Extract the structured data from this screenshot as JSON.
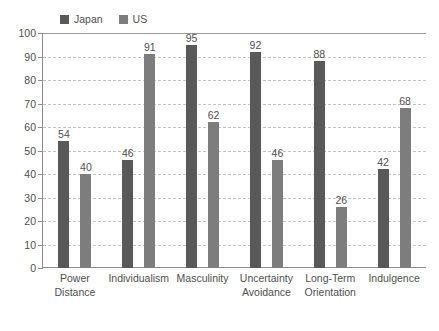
{
  "chart_data": {
    "type": "bar",
    "title": "",
    "xlabel": "",
    "ylabel": "",
    "ylim": [
      0,
      100
    ],
    "ytick_step": 10,
    "yticks": [
      100,
      90,
      80,
      70,
      60,
      50,
      40,
      30,
      20,
      10,
      0
    ],
    "grid": true,
    "legend_position": "top-left",
    "categories": [
      "Power Distance",
      "Individualism",
      "Masculinity",
      "Uncertainty Avoidance",
      "Long-Term Orientation",
      "Indulgence"
    ],
    "category_lines": [
      [
        "Power",
        "Distance"
      ],
      [
        "Individualism",
        ""
      ],
      [
        "Masculinity",
        ""
      ],
      [
        "Uncertainty",
        "Avoidance"
      ],
      [
        "Long-Term",
        "Orientation"
      ],
      [
        "Indulgence",
        ""
      ]
    ],
    "series": [
      {
        "name": "Japan",
        "color": "#595959",
        "values": [
          54,
          46,
          95,
          92,
          88,
          42
        ]
      },
      {
        "name": "US",
        "color": "#7d7d7d",
        "values": [
          40,
          91,
          62,
          46,
          26,
          68
        ]
      }
    ]
  },
  "legend": {
    "items": [
      {
        "label": "Japan",
        "color": "#595959"
      },
      {
        "label": "US",
        "color": "#7d7d7d"
      }
    ]
  },
  "axis": {
    "y_labels": [
      "100",
      "90",
      "80",
      "70",
      "60",
      "50",
      "40",
      "30",
      "20",
      "10",
      "0"
    ]
  },
  "colors": {
    "series_japan": "#595959",
    "series_us": "#7d7d7d",
    "axis": "#8d8d8d",
    "gridline": "#c2c2c2",
    "text": "#4f4f4f",
    "background": "#ffffff"
  }
}
